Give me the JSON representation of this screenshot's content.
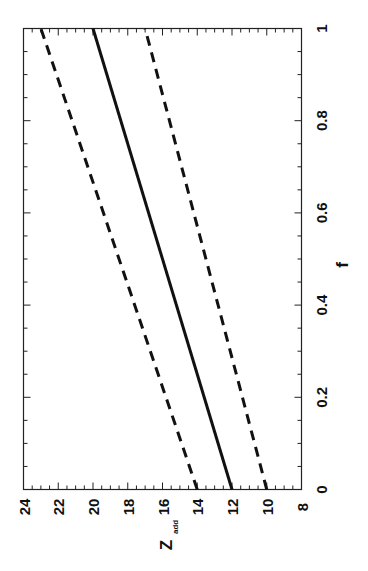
{
  "chart_data": {
    "type": "line",
    "title": "",
    "orientation": "rotated 90° counter-clockwise (f axis vertical on right, Z_add axis horizontal at bottom)",
    "xlabel": "f",
    "ylabel": "Z_add",
    "ylabel_main": "Z",
    "ylabel_sub": "add",
    "xlim": [
      0,
      1
    ],
    "ylim": [
      8,
      24
    ],
    "xticks": [
      "0",
      "0.2",
      "0.4",
      "0.6",
      "0.8",
      "1"
    ],
    "yticks": [
      "8",
      "10",
      "12",
      "14",
      "16",
      "18",
      "20",
      "22",
      "24"
    ],
    "grid": false,
    "legend": null,
    "series": [
      {
        "name": "central",
        "style": "solid",
        "x": [
          0,
          1
        ],
        "y": [
          12,
          20
        ]
      },
      {
        "name": "upper bound",
        "style": "dashed",
        "x": [
          0,
          1
        ],
        "y": [
          14,
          23
        ]
      },
      {
        "name": "lower bound",
        "style": "dashed",
        "x": [
          0,
          1
        ],
        "y": [
          10,
          17
        ]
      }
    ]
  }
}
